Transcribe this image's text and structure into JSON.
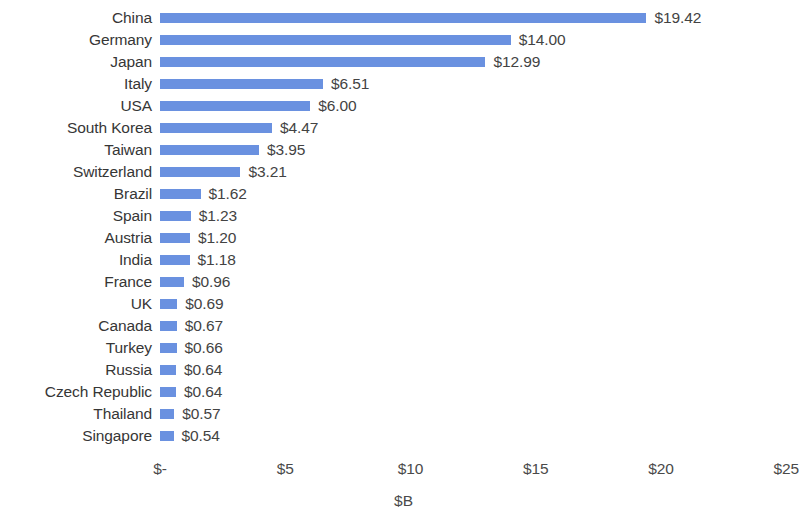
{
  "chart_data": {
    "type": "bar",
    "orientation": "horizontal",
    "title": "",
    "xlabel": "$B",
    "ylabel": "",
    "xlim": [
      0,
      25
    ],
    "grid": false,
    "legend": null,
    "bar_color": "#6a91e0",
    "value_label_format": "$0.00",
    "x_tick_labels": [
      "$-",
      "$5",
      "$10",
      "$15",
      "$20",
      "$25"
    ],
    "x_tick_values": [
      0,
      5,
      10,
      15,
      20,
      25
    ],
    "categories": [
      "China",
      "Germany",
      "Japan",
      "Italy",
      "USA",
      "South Korea",
      "Taiwan",
      "Switzerland",
      "Brazil",
      "Spain",
      "Austria",
      "India",
      "France",
      "UK",
      "Canada",
      "Turkey",
      "Russia",
      "Czech Republic",
      "Thailand",
      "Singapore"
    ],
    "values": [
      19.42,
      14.0,
      12.99,
      6.51,
      6.0,
      4.47,
      3.95,
      3.21,
      1.62,
      1.23,
      1.2,
      1.18,
      0.96,
      0.69,
      0.67,
      0.66,
      0.64,
      0.64,
      0.57,
      0.54
    ],
    "value_labels": [
      "$19.42",
      "$14.00",
      "$12.99",
      "$6.51",
      "$6.00",
      "$4.47",
      "$3.95",
      "$3.21",
      "$1.62",
      "$1.23",
      "$1.20",
      "$1.18",
      "$0.96",
      "$0.69",
      "$0.67",
      "$0.66",
      "$0.64",
      "$0.64",
      "$0.57",
      "$0.54"
    ]
  }
}
